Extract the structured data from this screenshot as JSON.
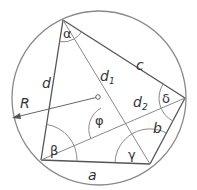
{
  "diagram": {
    "colors": {
      "stroke": "#8a8a8a",
      "edge": "#555555",
      "text": "#333333",
      "background": "#ffffff"
    },
    "circle": {
      "cx": 99,
      "cy": 98,
      "r": 87
    },
    "center_marker": {
      "x": 98,
      "y": 97
    },
    "vertices": {
      "A": {
        "x": 63,
        "y": 20
      },
      "B": {
        "x": 185,
        "y": 98
      },
      "C": {
        "x": 150,
        "y": 164
      },
      "D": {
        "x": 41,
        "y": 160
      }
    },
    "labels": {
      "side_a": "a",
      "side_b": "b",
      "side_c": "c",
      "side_d": "d",
      "diag_1": "d",
      "diag_1_sub": "1",
      "diag_2": "d",
      "diag_2_sub": "2",
      "radius": "R",
      "angle_alpha": "α",
      "angle_beta": "β",
      "angle_gamma": "γ",
      "angle_delta": "δ",
      "angle_phi": "φ"
    }
  }
}
